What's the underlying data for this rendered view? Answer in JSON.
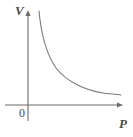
{
  "figure": {
    "name": "pressure-volume-inverse-curve",
    "background_color": "#ffffff",
    "axis_color": "#6b6b6b",
    "curve_color": "#7a7a7a",
    "label_color": "#4a4a4a",
    "y_axis": {
      "label": "V",
      "label_style": "italic",
      "x_px": 28,
      "top_px": 10,
      "bottom_px": 121,
      "arrow": "up"
    },
    "x_axis": {
      "label": "P",
      "label_style": "italic",
      "y_px": 105,
      "left_px": 5,
      "right_px": 123,
      "arrow": "right"
    },
    "origin": {
      "label": "0",
      "x_px": 28,
      "y_px": 105
    }
  },
  "chart_data": {
    "type": "line",
    "title": "",
    "subtitle": "",
    "xlabel": "P",
    "ylabel": "V",
    "grid": false,
    "legend": null,
    "annotations": [
      "0"
    ],
    "axis_arrows": {
      "x": "right",
      "y": "up"
    },
    "xlim": [
      0,
      10
    ],
    "ylim": [
      0,
      10
    ],
    "xticks": [],
    "yticks": [],
    "relationship": "inverse proportional (V = k / P), hyperbola",
    "series": [
      {
        "name": "V versus P",
        "x": [
          1.0,
          1.15,
          1.35,
          1.6,
          1.9,
          2.3,
          2.8,
          3.4,
          4.2,
          5.2,
          6.4,
          7.6,
          8.8,
          10.0
        ],
        "y": [
          9.4,
          8.2,
          7.0,
          5.9,
          5.0,
          4.1,
          3.4,
          2.8,
          2.3,
          1.85,
          1.5,
          1.3,
          1.15,
          1.05
        ]
      }
    ],
    "curve_pixel_path": "M 39,11 C 41,33 45,52 56,68 C 66,81 84,90 103,93 C 110,94 116,94 121,95"
  }
}
